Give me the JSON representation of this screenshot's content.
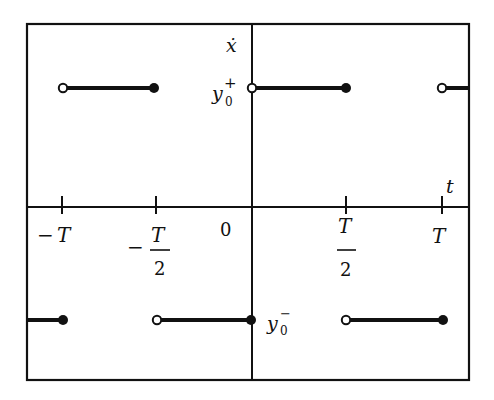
{
  "diagram": {
    "type": "piecewise-constant square wave",
    "axes": {
      "vertical_label": "ẋ",
      "horizontal_label": "t",
      "origin_label": "0"
    },
    "levels": {
      "upper": {
        "label_base": "y",
        "label_sub": "0",
        "label_sup": "+"
      },
      "lower": {
        "label_base": "y",
        "label_sub": "0",
        "label_sup": "−"
      }
    },
    "ticks": [
      {
        "id": "neg-T",
        "sign": "−",
        "num": "T",
        "den": ""
      },
      {
        "id": "neg-half-T",
        "sign": "−",
        "num": "T",
        "den": "2"
      },
      {
        "id": "half-T",
        "sign": "",
        "num": "T",
        "den": "2"
      },
      {
        "id": "T",
        "sign": "",
        "num": "T",
        "den": ""
      }
    ],
    "segments": [
      {
        "level": "upper",
        "from": "-T",
        "to": "-T/2",
        "start": "open",
        "end": "closed"
      },
      {
        "level": "upper",
        "from": "0",
        "to": "T/2",
        "start": "open",
        "end": "closed"
      },
      {
        "level": "upper",
        "from": "T",
        "to": "edge",
        "start": "open",
        "end": "none"
      },
      {
        "level": "lower",
        "from": "edge",
        "to": "-T",
        "start": "none",
        "end": "closed"
      },
      {
        "level": "lower",
        "from": "-T/2",
        "to": "0",
        "start": "open",
        "end": "closed"
      },
      {
        "level": "lower",
        "from": "T/2",
        "to": "T",
        "start": "open",
        "end": "closed"
      }
    ]
  }
}
